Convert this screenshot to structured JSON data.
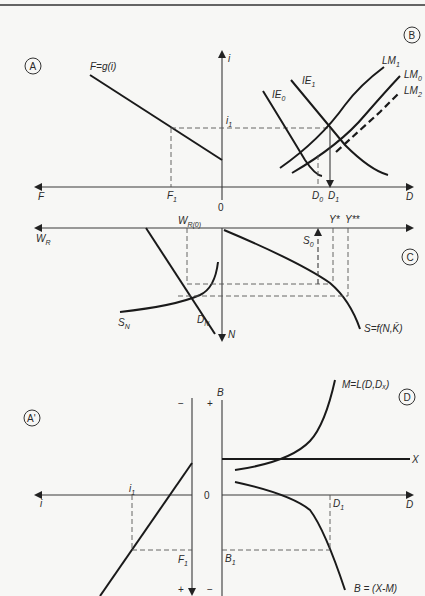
{
  "figure": {
    "panels": {
      "A": {
        "badge": "A",
        "curve_label": "F=g(i)",
        "axis_x_label": "F",
        "axis_y_label": "i",
        "tick_x": "F",
        "tick_x_sub": "1",
        "tick_y": "i",
        "tick_y_sub": "1"
      },
      "B": {
        "badge": "B",
        "axis_x_label": "D",
        "curves": {
          "IE0": {
            "main": "IE",
            "sub": "0"
          },
          "IE1": {
            "main": "IE",
            "sub": "1"
          },
          "LM1": {
            "main": "LM",
            "sub": "1"
          },
          "LM0": {
            "main": "LM",
            "sub": "0"
          },
          "LM2": {
            "main": "LM",
            "sub": "2"
          }
        },
        "tick_D0": {
          "main": "D",
          "sub": "0"
        },
        "tick_D1": {
          "main": "D",
          "sub": "1"
        }
      },
      "origin": "0",
      "C": {
        "badge": "C",
        "axis_left_label": {
          "main": "W",
          "sub": "R"
        },
        "axis_down_label": "N",
        "wr0": {
          "main": "W",
          "sub": "R(0)"
        },
        "s0": {
          "main": "S",
          "sub": "0"
        },
        "y_star": "Y*",
        "y_star2": "Y**",
        "sn": {
          "main": "S",
          "sub": "N"
        },
        "dn": {
          "main": "D",
          "sub": "N"
        },
        "production_fn": "S=f(N,K̄)"
      },
      "A_prime": {
        "badge": "A'",
        "axis_i": "i",
        "tick_i1": {
          "main": "i",
          "sub": "1"
        },
        "tick_F1": {
          "main": "F",
          "sub": "1"
        },
        "minus": "−",
        "plus": "+",
        "origin": "0"
      },
      "D": {
        "badge": "D",
        "axis_B": "B",
        "axis_D": "D",
        "plus": "+",
        "minus": "−",
        "tick_D1": {
          "main": "D",
          "sub": "1"
        },
        "tick_B1": {
          "main": "B",
          "sub": "1"
        },
        "import_label": "M=L(D,Dₓ)",
        "export_label": "X",
        "balance_label": "B = (X-M)"
      }
    }
  }
}
